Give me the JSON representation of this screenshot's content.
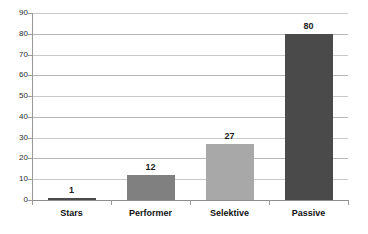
{
  "chart_data": {
    "type": "bar",
    "title": "",
    "subtitle": "",
    "xlabel": "",
    "ylabel": "",
    "categories": [
      "Stars",
      "Performer",
      "Selektive",
      "Passive"
    ],
    "values": [
      1,
      12,
      27,
      80
    ],
    "value_labels": [
      "1",
      "12",
      "27",
      "80"
    ],
    "bar_colors": [
      "#4a4a4a",
      "#808080",
      "#a8a8a8",
      "#4a4a4a"
    ],
    "ylim": [
      0,
      90
    ],
    "ytick_step": 10,
    "ytick_labels": [
      "90",
      "80",
      "70",
      "60",
      "50",
      "40",
      "30",
      "20",
      "10",
      "0"
    ],
    "ytick_values": [
      90,
      80,
      70,
      60,
      50,
      40,
      30,
      20,
      10,
      0
    ],
    "grid": "horizontal",
    "gridline_color": "#b7b7b7",
    "legend": "none",
    "background": "#ffffff",
    "value_label_color": "#1a1a1a",
    "axis_color": "#9a9a9a"
  }
}
